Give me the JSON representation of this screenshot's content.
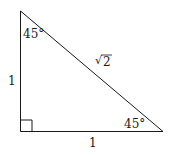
{
  "diagram": {
    "type": "right-triangle",
    "vertices": {
      "top": [
        20,
        11
      ],
      "bottom_left": [
        20,
        131
      ],
      "bottom_right": [
        163,
        131
      ]
    },
    "labels": {
      "top_angle": "45°",
      "bottom_right_angle": "45°",
      "left_side": "1",
      "bottom_side": "1",
      "hypotenuse_radical": "√",
      "hypotenuse_value": "2"
    },
    "right_angle_marker": true,
    "stroke_color": "#1a1a1a",
    "background": "#ffffff"
  }
}
